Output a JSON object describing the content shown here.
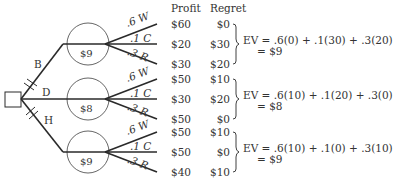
{
  "headers": {
    "profit": "Profit",
    "regret": "Regret"
  },
  "decision": {
    "branches": [
      {
        "label": "B",
        "ev_node": "$9",
        "outcomes": [
          {
            "prob": ".6",
            "state": "W",
            "label": ".6 W",
            "profit": "$60",
            "regret": "$0"
          },
          {
            "prob": ".1",
            "state": "C",
            "label": ".1 C",
            "profit": "$20",
            "regret": "$30"
          },
          {
            "prob": ".3",
            "state": "R",
            "label": ".3 R",
            "profit": "$30",
            "regret": "$20"
          }
        ],
        "ev_line1": "EV = .6(0) + .1(30) + .3(20)",
        "ev_line2": "= $9"
      },
      {
        "label": "D",
        "ev_node": "$8",
        "outcomes": [
          {
            "prob": ".6",
            "state": "W",
            "label": ".6 W",
            "profit": "$50",
            "regret": "$10"
          },
          {
            "prob": ".1",
            "state": "C",
            "label": ".1 C",
            "profit": "$30",
            "regret": "$20"
          },
          {
            "prob": ".3",
            "state": "R",
            "label": ".3 R",
            "profit": "$50",
            "regret": "$0"
          }
        ],
        "ev_line1": "EV = .6(10) + .1(20) + .3(0)",
        "ev_line2": "= $8"
      },
      {
        "label": "H",
        "ev_node": "$9",
        "outcomes": [
          {
            "prob": ".6",
            "state": "W",
            "label": ".6 W",
            "profit": "$50",
            "regret": "$10"
          },
          {
            "prob": ".1",
            "state": "C",
            "label": ".1 C",
            "profit": "$50",
            "regret": "$0"
          },
          {
            "prob": ".3",
            "state": "R",
            "label": ".3 R",
            "profit": "$40",
            "regret": "$10"
          }
        ],
        "ev_line1": "EV = .6(10) + .1(0) + .3(10)",
        "ev_line2": "= $9"
      }
    ]
  },
  "colors": {
    "ink": "#2a2a2a",
    "background": "#ffffff"
  }
}
